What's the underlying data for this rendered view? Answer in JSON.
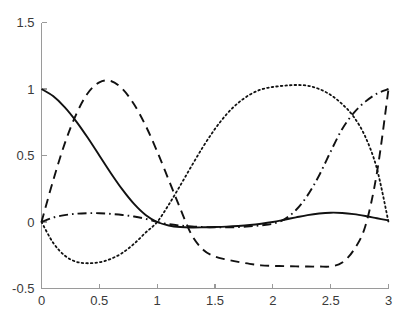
{
  "figure": {
    "background_color": "#ffffff",
    "axis_color": "#9a9a9a",
    "curve_color": "#111111"
  },
  "chart_data": {
    "type": "line",
    "title": "",
    "subtitle": "",
    "xlabel": "",
    "ylabel": "",
    "xlim": [
      0,
      3
    ],
    "ylim": [
      -0.5,
      1.5
    ],
    "xticks": [
      0,
      0.5,
      1,
      1.5,
      2,
      2.5,
      3
    ],
    "xticklabels": [
      "0",
      "0.5",
      "1",
      "1.5",
      "2",
      "2.5",
      "3"
    ],
    "yticks": [
      -0.5,
      0,
      0.5,
      1,
      1.5
    ],
    "yticklabels": [
      "-0.5",
      "0",
      "0.5",
      "1",
      "1.5"
    ],
    "grid": false,
    "legend": "none",
    "x": [
      0,
      0.1,
      0.2,
      0.3,
      0.4,
      0.5,
      0.6,
      0.7,
      0.8,
      0.9,
      1,
      1.1,
      1.2,
      1.3,
      1.4,
      1.5,
      1.6,
      1.7,
      1.8,
      1.9,
      2,
      2.1,
      2.2,
      2.3,
      2.4,
      2.5,
      2.6,
      2.7,
      2.8,
      2.9,
      3
    ],
    "series": [
      {
        "name": "curve-1",
        "style": "solid",
        "values": [
          1.0,
          0.947,
          0.864,
          0.757,
          0.633,
          0.5,
          0.367,
          0.243,
          0.136,
          0.053,
          0.0,
          -0.026,
          -0.038,
          -0.041,
          -0.04,
          -0.038,
          -0.035,
          -0.03,
          -0.023,
          -0.013,
          0.0,
          0.017,
          0.035,
          0.052,
          0.064,
          0.07,
          0.068,
          0.059,
          0.045,
          0.028,
          0.012
        ]
      },
      {
        "name": "curve-2",
        "style": "dashed",
        "values": [
          0.0,
          0.31,
          0.587,
          0.81,
          0.968,
          1.05,
          1.06,
          1.0,
          0.885,
          0.725,
          0.53,
          0.316,
          0.1,
          -0.1,
          -0.21,
          -0.26,
          -0.282,
          -0.3,
          -0.315,
          -0.326,
          -0.33,
          -0.332,
          -0.334,
          -0.335,
          -0.335,
          -0.334,
          -0.305,
          -0.21,
          -0.03,
          0.37,
          1.0
        ]
      },
      {
        "name": "curve-3",
        "style": "dotted",
        "values": [
          0.0,
          -0.155,
          -0.252,
          -0.299,
          -0.31,
          -0.303,
          -0.277,
          -0.232,
          -0.164,
          -0.08,
          0.0,
          0.13,
          0.275,
          0.425,
          0.57,
          0.7,
          0.81,
          0.895,
          0.957,
          0.997,
          1.015,
          1.025,
          1.03,
          1.025,
          1.0,
          0.955,
          0.886,
          0.79,
          0.64,
          0.4,
          0.0
        ]
      },
      {
        "name": "curve-4",
        "style": "dashdot",
        "values": [
          0.0,
          0.033,
          0.052,
          0.062,
          0.066,
          0.066,
          0.061,
          0.053,
          0.041,
          0.024,
          0.0,
          -0.016,
          -0.027,
          -0.034,
          -0.038,
          -0.04,
          -0.04,
          -0.038,
          -0.033,
          -0.025,
          -0.013,
          0.02,
          0.09,
          0.2,
          0.35,
          0.53,
          0.7,
          0.82,
          0.905,
          0.965,
          1.0
        ]
      }
    ]
  }
}
